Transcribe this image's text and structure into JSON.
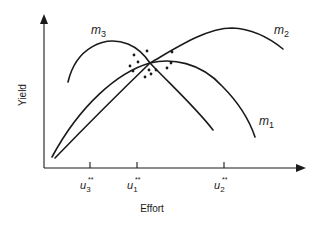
{
  "diagram": {
    "x_axis_label": "Effort",
    "y_axis_label": "Yield",
    "curves": [
      {
        "id": "m3",
        "base": "m",
        "sub": "3"
      },
      {
        "id": "m2",
        "base": "m",
        "sub": "2"
      },
      {
        "id": "m1",
        "base": "m",
        "sub": "1"
      }
    ],
    "ticks": [
      {
        "id": "u3",
        "base": "u",
        "sub": "3",
        "sup": "**"
      },
      {
        "id": "u1",
        "base": "u",
        "sub": "1",
        "sup": "**"
      },
      {
        "id": "u2",
        "base": "u",
        "sub": "2",
        "sup": "**"
      }
    ],
    "scatter_cluster": "observations clustered around the common intersection of the three curves"
  }
}
